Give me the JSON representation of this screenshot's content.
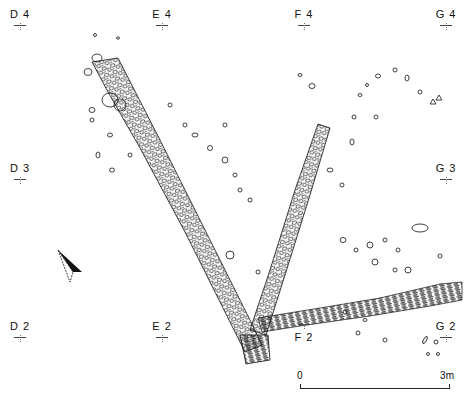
{
  "figure": {
    "type": "archaeological site plan"
  },
  "grid_markers": [
    {
      "label": "D 4",
      "x": 18,
      "y": 14
    },
    {
      "label": "E 4",
      "x": 160,
      "y": 14
    },
    {
      "label": "F 4",
      "x": 302,
      "y": 14
    },
    {
      "label": "G 4",
      "x": 444,
      "y": 14
    },
    {
      "label": "D 3",
      "x": 18,
      "y": 165
    },
    {
      "label": "G 3",
      "x": 444,
      "y": 165
    },
    {
      "label": "D 2",
      "x": 18,
      "y": 323
    },
    {
      "label": "E 2",
      "x": 160,
      "y": 323
    },
    {
      "label": "F 2",
      "x": 302,
      "y": 320
    },
    {
      "label": "G 2",
      "x": 444,
      "y": 323
    }
  ],
  "scale_bar": {
    "start_label": "0",
    "end_label": "3m"
  },
  "north_arrow": {
    "icon": "north-arrow-icon"
  }
}
